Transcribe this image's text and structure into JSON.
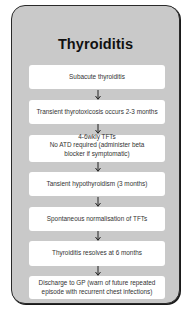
{
  "title": "Thyroiditis",
  "steps": [
    {
      "lines": [
        "Subacute thyroiditis"
      ]
    },
    {
      "lines": [
        "Transient thyrotoxicosis occurs 2-3 months"
      ]
    },
    {
      "lines": [
        "4-6wkly TFTs",
        "No ATD required (administer beta",
        "blocker if symptomatic)"
      ]
    },
    {
      "lines": [
        "Tansient hypothyroidism (3 months)"
      ]
    },
    {
      "lines": [
        "Spontaneous normalisation of TFTs"
      ]
    },
    {
      "lines": [
        "Thyroiditis resolves at 6 months"
      ]
    },
    {
      "lines": [
        "Discharge to GP (warn of future repeated",
        "episode with recurrent chest infections)"
      ]
    }
  ],
  "arrow_icon": "down-arrow-icon",
  "colors": {
    "panel_fill": "#c9c9c9",
    "panel_border": "#2a2a2a",
    "box_fill": "#ffffff",
    "text": "#333333",
    "title_text": "#111111"
  }
}
